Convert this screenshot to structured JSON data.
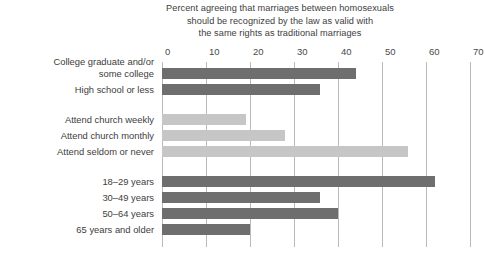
{
  "chart_data": {
    "type": "bar",
    "orientation": "horizontal",
    "title": "Percent agreeing that marriages between homosexuals should be recognized by the law as valid with the same rights as traditional marriages",
    "title_lines": [
      "Percent agreeing that marriages between homosexuals",
      "should be recognized by the law as valid with",
      "the same rights as traditional marriages"
    ],
    "xlabel": "",
    "ylabel": "",
    "xlim": [
      0,
      70
    ],
    "xticks": [
      0,
      10,
      20,
      30,
      40,
      50,
      60,
      70
    ],
    "xticklabels": [
      "0",
      "10",
      "20",
      "30",
      "40",
      "50",
      "60",
      "70"
    ],
    "grid": "vertical",
    "legend": "none",
    "groups": [
      {
        "name": "education",
        "color": "#6e6e6e",
        "categories": [
          "College graduate and/or some college",
          "High school or less"
        ],
        "values": [
          44,
          36
        ]
      },
      {
        "name": "church-attendance",
        "color": "#c6c6c6",
        "categories": [
          "Attend church weekly",
          "Attend church monthly",
          "Attend seldom or never"
        ],
        "values": [
          19,
          28,
          56
        ]
      },
      {
        "name": "age",
        "color": "#6e6e6e",
        "categories": [
          "18–29 years",
          "30–49 years",
          "50–64 years",
          "65 years and older"
        ],
        "values": [
          62,
          36,
          40,
          20
        ]
      }
    ],
    "bars": [
      {
        "label": "College graduate and/or some college",
        "label_lines": [
          "College graduate and/or",
          "some college"
        ],
        "value": 44,
        "color": "#6e6e6e"
      },
      {
        "label": "High school or less",
        "label_lines": [
          "High school or less"
        ],
        "value": 36,
        "color": "#6e6e6e"
      },
      {
        "label": "Attend church weekly",
        "label_lines": [
          "Attend church weekly"
        ],
        "value": 19,
        "color": "#c6c6c6"
      },
      {
        "label": "Attend church monthly",
        "label_lines": [
          "Attend church monthly"
        ],
        "value": 28,
        "color": "#c6c6c6"
      },
      {
        "label": "Attend seldom or never",
        "label_lines": [
          "Attend seldom or never"
        ],
        "value": 56,
        "color": "#c6c6c6"
      },
      {
        "label": "18–29 years",
        "label_lines": [
          "18–29 years"
        ],
        "value": 62,
        "color": "#6e6e6e"
      },
      {
        "label": "30–49 years",
        "label_lines": [
          "30–49 years"
        ],
        "value": 36,
        "color": "#6e6e6e"
      },
      {
        "label": "50–64 years",
        "label_lines": [
          "50–64 years"
        ],
        "value": 40,
        "color": "#6e6e6e"
      },
      {
        "label": "65 years and older",
        "label_lines": [
          "65 years and older"
        ],
        "value": 20,
        "color": "#6e6e6e"
      }
    ],
    "colors": {
      "bar_dark": "#6e6e6e",
      "bar_light": "#c6c6c6",
      "gridline": "#b9b9b9",
      "text": "#3d3d3d",
      "background": "#ffffff"
    }
  }
}
